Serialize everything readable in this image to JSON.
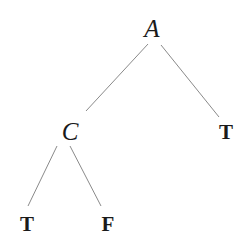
{
  "diagram": {
    "type": "binary-decision-tree",
    "nodes": [
      {
        "id": "A",
        "label": "A",
        "kind": "variable",
        "x": 152,
        "y": 28
      },
      {
        "id": "C",
        "label": "C",
        "kind": "variable",
        "x": 70,
        "y": 131
      },
      {
        "id": "T1",
        "label": "T",
        "kind": "leaf",
        "x": 226,
        "y": 132
      },
      {
        "id": "T2",
        "label": "T",
        "kind": "leaf",
        "x": 27,
        "y": 224
      },
      {
        "id": "F1",
        "label": "F",
        "kind": "leaf",
        "x": 108,
        "y": 224
      }
    ],
    "edges": [
      {
        "from": "A",
        "to": "C",
        "x1": 148,
        "y1": 44,
        "x2": 86,
        "y2": 111
      },
      {
        "from": "A",
        "to": "T1",
        "x1": 161,
        "y1": 45,
        "x2": 219,
        "y2": 117
      },
      {
        "from": "C",
        "to": "T2",
        "x1": 57,
        "y1": 146,
        "x2": 28,
        "y2": 206
      },
      {
        "from": "C",
        "to": "F1",
        "x1": 70,
        "y1": 146,
        "x2": 101,
        "y2": 206
      }
    ],
    "colors": {
      "edge": "#8a8a8a",
      "text": "#1a1a1a",
      "background": "#ffffff"
    }
  }
}
